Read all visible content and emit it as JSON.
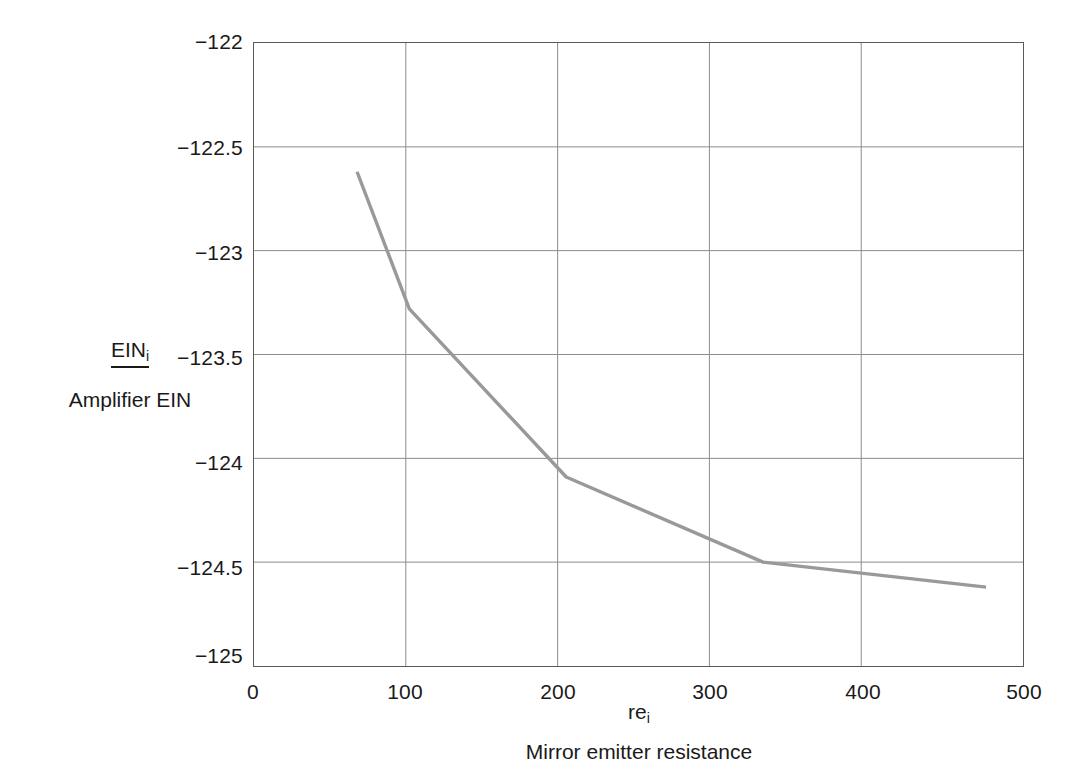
{
  "chart_data": {
    "type": "line",
    "title": "",
    "subtitle": "",
    "xlabel_symbol": "re",
    "xlabel_symbol_sub": "i",
    "xlabel_description": "Mirror emitter resistance",
    "ylabel_symbol": "EIN",
    "ylabel_symbol_sub": "i",
    "ylabel_description": "Amplifier EIN",
    "xlim": [
      0,
      500
    ],
    "ylim": [
      -125,
      -122
    ],
    "xticks": [
      0,
      100,
      200,
      300,
      400,
      500
    ],
    "yticks": [
      -122,
      -122.5,
      -123,
      -123.5,
      -124,
      -124.5,
      -125
    ],
    "xtick_labels": [
      "0",
      "100",
      "200",
      "300",
      "400",
      "500"
    ],
    "ytick_labels": [
      "−122",
      "−122.5",
      "−123",
      "−123.5",
      "−124",
      "−124.5",
      "−125"
    ],
    "grid": true,
    "grid_color": "#8c8c8c",
    "legend": null,
    "series": [
      {
        "name": "Amplifier EIN",
        "color": "#999999",
        "linewidth": 3,
        "x": [
          67,
          101,
          203,
          331,
          476
        ],
        "y": [
          -122.62,
          -123.28,
          -124.09,
          -124.5,
          -124.62
        ]
      }
    ]
  },
  "axes": {
    "x": {
      "symbol": "re",
      "subscript": "i",
      "description": "Mirror emitter resistance",
      "ticks": [
        "0",
        "100",
        "200",
        "300",
        "400",
        "500"
      ]
    },
    "y": {
      "symbol": "EIN",
      "subscript": "i",
      "description": "Amplifier EIN",
      "ticks": [
        "−122",
        "−122.5",
        "−123",
        "−123.5",
        "−124",
        "−124.5",
        "−125"
      ]
    }
  },
  "colors": {
    "line": "#999999",
    "grid": "#8c8c8c",
    "frame": "#5a5a5a",
    "text": "#1a1a1a",
    "background": "#ffffff"
  }
}
